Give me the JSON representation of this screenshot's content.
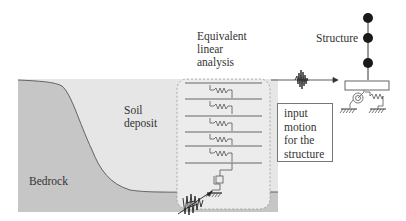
{
  "diagram": {
    "labels": {
      "soil_deposit": "Soil deposit",
      "bedrock": "Bedrock",
      "equivalent_linear_analysis": "Equivalent linear analysis",
      "structure": "Structure",
      "input_motion": "input motion for the structure"
    },
    "soil_column": {
      "layers": 6,
      "springs": 5,
      "base_dashpot": true
    },
    "structure_model": {
      "masses": 3,
      "base": "foundation slab with rotational and translational springs"
    },
    "colors": {
      "bedrock": "#c4c4c4",
      "soil": "#e6e6e6",
      "column_box": "#ebebeb",
      "lines": "#555555",
      "mass": "#1a1a1a"
    }
  }
}
